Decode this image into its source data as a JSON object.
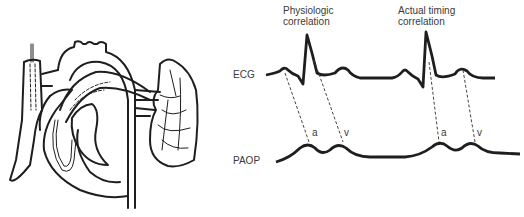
{
  "labels": {
    "physiologic": [
      "Physiologic",
      "correlation"
    ],
    "actual": [
      "Actual timing",
      "correlation"
    ],
    "ecg": "ECG",
    "paop": "PAOP",
    "a_wave_1": "a",
    "v_wave_1": "v",
    "a_wave_2": "a",
    "v_wave_2": "v"
  },
  "illustration": {
    "subject": "heart with pulmonary artery catheter and lung"
  },
  "colors": {
    "ink": "#1e1e1e",
    "background": "#ffffff"
  }
}
